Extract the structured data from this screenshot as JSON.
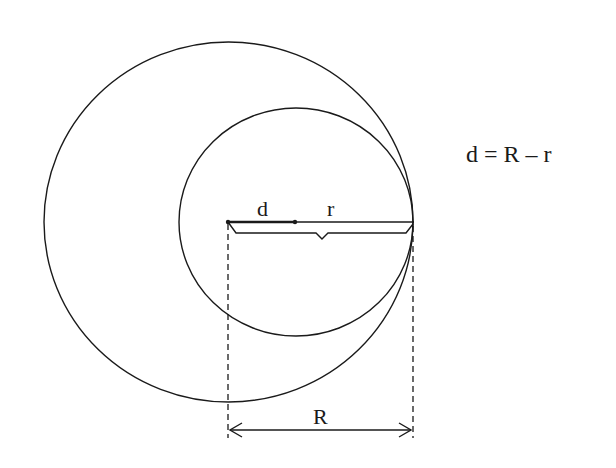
{
  "diagram": {
    "labels": {
      "d": "d",
      "r": "r",
      "R": "R"
    },
    "formula": "d = R – r",
    "colors": {
      "line": "#1a1a1a",
      "background": "#ffffff"
    },
    "geometry": {
      "large_circle": {
        "cx": 228.5,
        "cy": 222,
        "rx": 184.5,
        "ry": 180
      },
      "small_circle": {
        "cx": 296,
        "cy": 222,
        "rx": 117,
        "ry": 114
      },
      "tangent_point": {
        "x": 413,
        "y": 222
      },
      "d_segment": {
        "x1": 228,
        "x2": 295,
        "y": 222
      },
      "r_segment": {
        "x1": 295,
        "x2": 413,
        "y": 222
      },
      "R_dimension": {
        "x1": 228,
        "x2": 413,
        "y": 430
      }
    }
  }
}
